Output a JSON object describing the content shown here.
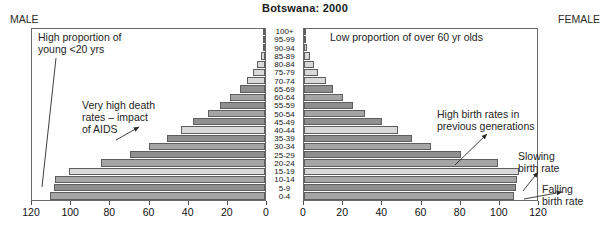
{
  "chart_data": {
    "type": "bar",
    "subtype": "population-pyramid",
    "title": "Botswana: 2000",
    "xlabel": "",
    "ylabel": "",
    "grid": false,
    "legend": null,
    "left_panel_label": "MALE",
    "right_panel_label": "FEMALE",
    "categories": [
      "0-4",
      "5-9",
      "10-14",
      "15-19",
      "20-24",
      "25-29",
      "30-34",
      "35-39",
      "40-44",
      "45-49",
      "50-54",
      "55-59",
      "60-64",
      "65-69",
      "70-74",
      "75-79",
      "80-84",
      "85-89",
      "90-94",
      "95-99",
      "100+"
    ],
    "axis": {
      "left_ticks": [
        120,
        100,
        80,
        60,
        40,
        20,
        0
      ],
      "right_ticks": [
        0,
        20,
        40,
        60,
        80,
        100,
        120
      ],
      "left_xlim": [
        120,
        0
      ],
      "right_xlim": [
        0,
        120
      ],
      "tick_step": 20
    },
    "series": [
      {
        "name": "MALE",
        "side": "left",
        "values": [
          110,
          108,
          107,
          100,
          84,
          69,
          59,
          50,
          43,
          37,
          29,
          23,
          18,
          13,
          9,
          6,
          4,
          2,
          1,
          0.5,
          0.2
        ]
      },
      {
        "name": "FEMALE",
        "side": "right",
        "values": [
          107,
          108,
          109,
          110,
          99,
          80,
          65,
          55,
          48,
          40,
          31,
          25,
          20,
          15,
          11,
          7,
          5,
          3,
          1.5,
          0.7,
          0.3
        ]
      }
    ],
    "annotations": [
      {
        "id": "young",
        "text": "High proportion of\nyoung <20 yrs",
        "side": "left"
      },
      {
        "id": "aids",
        "text": "Very high death\nrates – impact\nof AIDS",
        "side": "left"
      },
      {
        "id": "over60",
        "text": "Low proportion of over 60 yr olds",
        "side": "right"
      },
      {
        "id": "highbr",
        "text": "High birth rates in\nprevious generations",
        "side": "right"
      },
      {
        "id": "slowing",
        "text": "Slowing\nbirth rate",
        "side": "right"
      },
      {
        "id": "falling",
        "text": "Falling\nbirth rate",
        "side": "right"
      }
    ],
    "colors": {
      "bar_dark": "#8f8f8f",
      "bar_mid": "#a5a5a5",
      "bar_light": "#d9d9d9",
      "bar_stroke": "#5e5e5e",
      "frame": "#6a6a6a",
      "text": "#1a1a1a",
      "background": "#ffffff"
    },
    "bar_shades": [
      "mid",
      "dark",
      "mid",
      "light",
      "mid",
      "dark",
      "mid",
      "dark",
      "light",
      "dark",
      "mid",
      "dark",
      "mid",
      "dark",
      "light",
      "light",
      "light",
      "light",
      "light",
      "light",
      "light"
    ]
  }
}
